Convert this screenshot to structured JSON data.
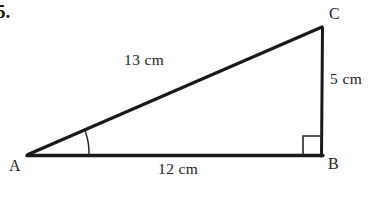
{
  "problem": {
    "number": "5."
  },
  "figure": {
    "type": "right-triangle",
    "vertices": [
      {
        "name": "A",
        "label": "A",
        "x": 28,
        "y": 155,
        "angle_marked": true
      },
      {
        "name": "B",
        "label": "B",
        "x": 322,
        "y": 155,
        "right_angle": true
      },
      {
        "name": "C",
        "label": "C",
        "x": 322,
        "y": 27,
        "right_angle": false
      }
    ],
    "sides": [
      {
        "name": "AC",
        "label": "13 cm",
        "value": 13,
        "unit": "cm",
        "role": "hypotenuse"
      },
      {
        "name": "AB",
        "label": "12 cm",
        "value": 12,
        "unit": "cm",
        "role": "adjacent-base"
      },
      {
        "name": "BC",
        "label": "5 cm",
        "value": 5,
        "unit": "cm",
        "role": "opposite-vertical"
      }
    ],
    "markers": {
      "right_angle_at": "B",
      "angle_arc_at": "A"
    },
    "colors": {
      "stroke": "#1a1a1d",
      "text": "#242428",
      "background": "#ffffff"
    }
  }
}
